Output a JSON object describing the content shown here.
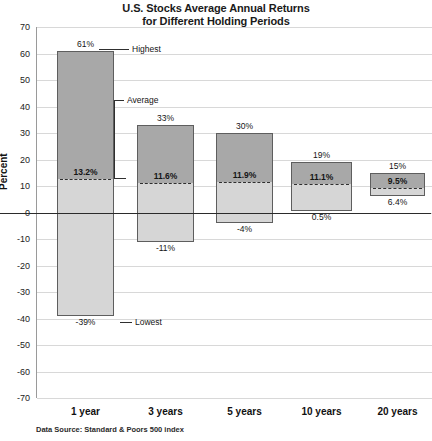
{
  "chart_data": {
    "type": "bar",
    "title": "U.S. Stocks Average Annual Returns for Different Holding Periods",
    "title_line1": "U.S. Stocks Average Annual Returns",
    "title_line2": "for Different Holding Periods",
    "xlabel": "",
    "ylabel": "Percent",
    "ylim": [
      -70,
      70
    ],
    "ytick_step": 10,
    "yticks": [
      70,
      60,
      50,
      40,
      30,
      20,
      10,
      0,
      -10,
      -20,
      -30,
      -40,
      -50,
      -60,
      -70
    ],
    "ytick_labels": [
      "70",
      "60",
      "50",
      "40",
      "30",
      "20",
      "10",
      "0",
      "-10",
      "-20",
      "-30",
      "-40",
      "-50",
      "-60",
      "-70"
    ],
    "grid": true,
    "legend": "none",
    "categories": [
      "1 year",
      "3 years",
      "5 years",
      "10 years",
      "20 years"
    ],
    "series": [
      {
        "name": "Highest",
        "values": [
          61,
          33,
          30,
          19,
          15
        ]
      },
      {
        "name": "Average",
        "values": [
          13.2,
          11.6,
          11.9,
          11.1,
          9.5
        ]
      },
      {
        "name": "Lowest",
        "values": [
          -39,
          -11,
          -4,
          0.5,
          6.4
        ]
      }
    ],
    "bars": [
      {
        "category": "1 year",
        "highest": 61,
        "average": 13.2,
        "lowest": -39,
        "highest_label": "61%",
        "average_label": "13.2%",
        "lowest_label": "-39%"
      },
      {
        "category": "3 years",
        "highest": 33,
        "average": 11.6,
        "lowest": -11,
        "highest_label": "33%",
        "average_label": "11.6%",
        "lowest_label": "-11%"
      },
      {
        "category": "5 years",
        "highest": 30,
        "average": 11.9,
        "lowest": -4,
        "highest_label": "30%",
        "average_label": "11.9%",
        "lowest_label": "-4%"
      },
      {
        "category": "10 years",
        "highest": 19,
        "average": 11.1,
        "lowest": 0.5,
        "highest_label": "19%",
        "average_label": "11.1%",
        "lowest_label": "0.5%"
      },
      {
        "category": "20 years",
        "highest": 15,
        "average": 9.5,
        "lowest": 6.4,
        "highest_label": "15%",
        "average_label": "9.5%",
        "lowest_label": "6.4%"
      }
    ],
    "annotations": [
      {
        "name": "highest",
        "text": "Highest"
      },
      {
        "name": "average",
        "text": "Average"
      },
      {
        "name": "lowest",
        "text": "Lowest"
      }
    ],
    "source_note": "Data Source: Standard & Poors 500 index",
    "colors": {
      "bar_upper_fill": "#a8a8a8",
      "bar_lower_fill": "#d6d6d6",
      "bar_border": "#5e5e5e",
      "gridline": "#d8d8d8",
      "axis": "#9a9a9a",
      "zeroline": "#2b2b2b",
      "text": "#151515",
      "background": "#ffffff"
    }
  }
}
